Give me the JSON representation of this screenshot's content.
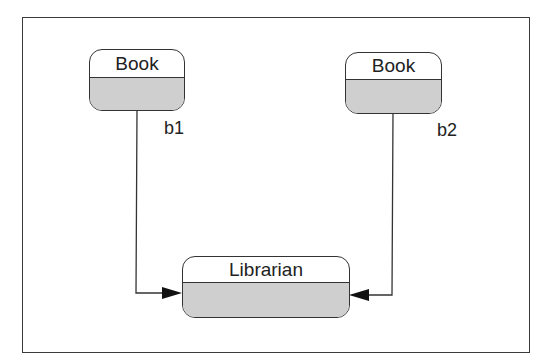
{
  "diagram": {
    "type": "object-diagram",
    "colors": {
      "line": "#333333",
      "compartment_fill": "#cfcfcf",
      "background": "#ffffff"
    },
    "objects": [
      {
        "id": "b1",
        "class_name": "Book",
        "role_label": "b1"
      },
      {
        "id": "b2",
        "class_name": "Book",
        "role_label": "b2"
      },
      {
        "id": "librarian",
        "class_name": "Librarian"
      }
    ],
    "links": [
      {
        "from": "b1",
        "to": "librarian",
        "arrow": "filled-triangle"
      },
      {
        "from": "b2",
        "to": "librarian",
        "arrow": "filled-triangle"
      }
    ]
  }
}
